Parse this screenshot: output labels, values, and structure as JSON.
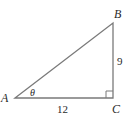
{
  "diagram": {
    "type": "right-triangle",
    "vertices": {
      "A": {
        "label": "A",
        "x": 15,
        "y": 98
      },
      "B": {
        "label": "B",
        "x": 113,
        "y": 23
      },
      "C": {
        "label": "C",
        "x": 113,
        "y": 98
      }
    },
    "sides": {
      "AC": {
        "label": "12"
      },
      "BC": {
        "label": "9"
      }
    },
    "angle": {
      "vertex": "A",
      "label": "θ"
    },
    "right_angle_at": "C",
    "colors": {
      "stroke": "#7a7a7a",
      "text": "#2a2a2a",
      "background": "#ffffff"
    }
  }
}
